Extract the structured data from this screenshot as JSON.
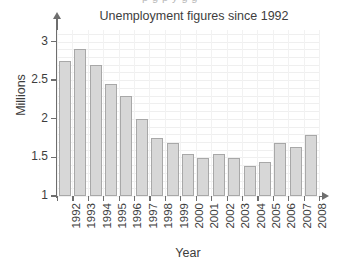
{
  "clipped_header_text": "p g p y g g",
  "chart_data": {
    "type": "bar",
    "title": "Unemployment figures since 1992",
    "xlabel": "Year",
    "ylabel": "Millions",
    "categories": [
      "1992",
      "1993",
      "1994",
      "1995",
      "1996",
      "1997",
      "1998",
      "1999",
      "2000",
      "2001",
      "2002",
      "2003",
      "2004",
      "2005",
      "2006",
      "2007",
      "2008"
    ],
    "values": [
      2.75,
      2.9,
      2.7,
      2.45,
      2.3,
      2.0,
      1.75,
      1.69,
      1.55,
      1.49,
      1.55,
      1.49,
      1.39,
      1.44,
      1.69,
      1.64,
      1.79
    ],
    "ylim": [
      1,
      3.15
    ],
    "ytick_values": [
      1,
      1.5,
      2,
      2.5,
      3
    ],
    "ytick_labels": [
      "1",
      "1.5",
      "2",
      "2.5",
      "3"
    ],
    "grid": true,
    "legend": null,
    "bar_fill_color": "#d7d7d7",
    "bar_edge_color": "#a8a8a8",
    "axis_color": "#6e6e6e",
    "grid_color": "#efefef",
    "text_color": "#3d3d3d"
  }
}
